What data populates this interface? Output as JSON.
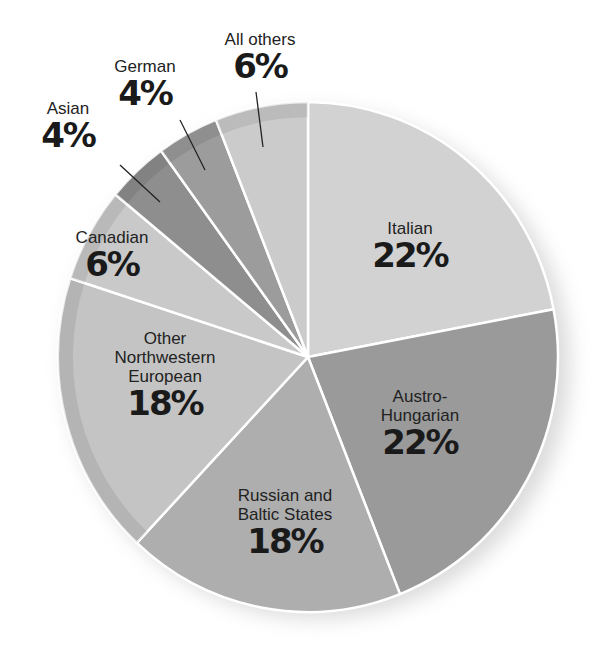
{
  "chart_data": {
    "type": "pie",
    "title": "",
    "start_angle_deg": 0,
    "direction": "clockwise",
    "slices": [
      {
        "label": "Italian",
        "value": 22,
        "display": "22%",
        "color": "#d2d2d2"
      },
      {
        "label": "Austro-Hungarian",
        "value": 22,
        "display": "22%",
        "color": "#9a9a9a"
      },
      {
        "label": "Russian and Baltic States",
        "value": 18,
        "display": "18%",
        "color": "#aeaeae"
      },
      {
        "label": "Other Northwestern European",
        "value": 18,
        "display": "18%",
        "color": "#c4c4c4"
      },
      {
        "label": "Canadian",
        "value": 6,
        "display": "6%",
        "color": "#c9c9c9"
      },
      {
        "label": "Asian",
        "value": 4,
        "display": "4%",
        "color": "#8e8e8e"
      },
      {
        "label": "German",
        "value": 4,
        "display": "4%",
        "color": "#9c9c9c"
      },
      {
        "label": "All others",
        "value": 6,
        "display": "6%",
        "color": "#cbcbcb"
      }
    ]
  },
  "labels": {
    "italian": {
      "name": "Italian",
      "pct": "22%"
    },
    "austro": {
      "name_line1": "Austro-",
      "name_line2": "Hungarian",
      "pct": "22%"
    },
    "russian": {
      "name_line1": "Russian and",
      "name_line2": "Baltic States",
      "pct": "18%"
    },
    "other_nw": {
      "name_line1": "Other",
      "name_line2": "Northwestern",
      "name_line3": "European",
      "pct": "18%"
    },
    "canadian": {
      "name": "Canadian",
      "pct": "6%"
    },
    "asian": {
      "name": "Asian",
      "pct": "4%"
    },
    "german": {
      "name": "German",
      "pct": "4%"
    },
    "all_others": {
      "name": "All others",
      "pct": "6%"
    }
  }
}
